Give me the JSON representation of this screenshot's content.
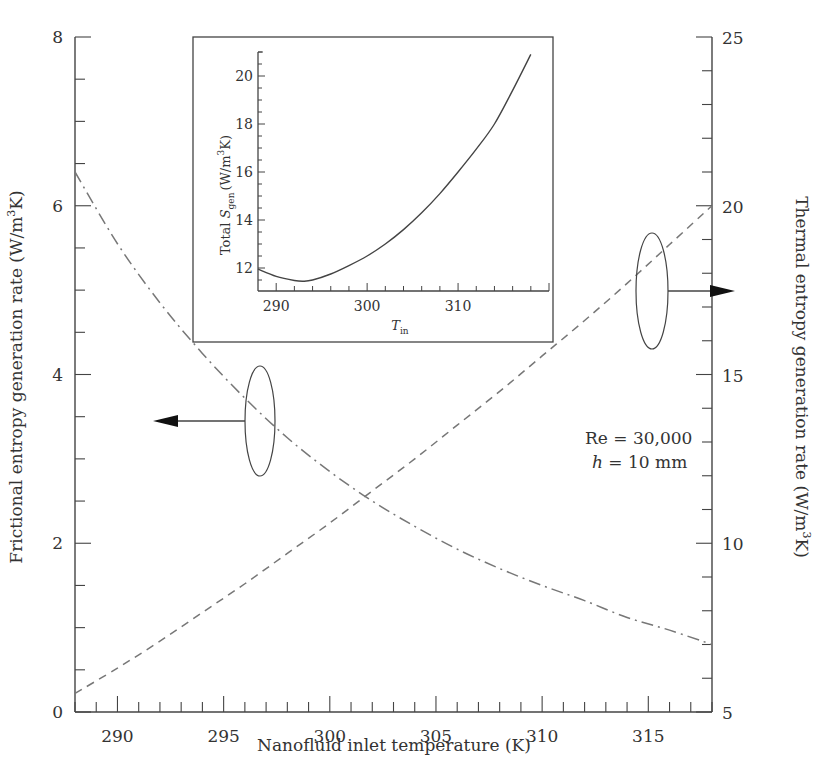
{
  "chart_data": [
    {
      "id": "main",
      "type": "line",
      "title": "",
      "xlabel": "Nanofluid inlet temperature (K)",
      "ylabel_left": "Frictional entropy generation rate (W/m³K)",
      "ylabel_right": "Thermal entropy generation rate (W/m³K)",
      "xlim": [
        288,
        318
      ],
      "ylim_left": [
        0,
        8
      ],
      "ylim_right": [
        5,
        25
      ],
      "x_ticks": [
        290,
        295,
        300,
        305,
        310,
        315
      ],
      "y_left_ticks": [
        0,
        2,
        4,
        6,
        8
      ],
      "y_right_ticks": [
        5,
        10,
        15,
        20,
        25
      ],
      "grid": false,
      "series": [
        {
          "name": "Frictional entropy generation rate",
          "axis": "left",
          "style": "dash-dot",
          "x": [
            288,
            290,
            292,
            294,
            296,
            298,
            300,
            302,
            304,
            306,
            308,
            310,
            312,
            314,
            316,
            318
          ],
          "values": [
            6.4,
            5.55,
            4.85,
            4.25,
            3.72,
            3.25,
            2.85,
            2.5,
            2.2,
            1.93,
            1.7,
            1.5,
            1.32,
            1.12,
            0.97,
            0.8
          ]
        },
        {
          "name": "Thermal entropy generation rate",
          "axis": "right",
          "style": "dashed",
          "x": [
            288,
            290,
            292,
            294,
            296,
            298,
            300,
            302,
            304,
            306,
            308,
            310,
            312,
            314,
            316,
            318
          ],
          "values": [
            5.55,
            6.3,
            7.1,
            7.95,
            8.8,
            9.7,
            10.6,
            11.55,
            12.5,
            13.5,
            14.5,
            15.55,
            16.6,
            17.7,
            18.85,
            20.0
          ]
        }
      ],
      "annotations": [
        {
          "text": "Re = 30,000"
        },
        {
          "text": "h = 10 mm",
          "italic_part": "h"
        },
        {
          "type": "ellipse-arrow",
          "points_to": "left axis",
          "series": "Frictional entropy generation rate"
        },
        {
          "type": "ellipse-arrow",
          "points_to": "right axis",
          "series": "Thermal entropy generation rate"
        }
      ]
    },
    {
      "id": "inset",
      "type": "line",
      "title": "",
      "xlabel": "T_in",
      "ylabel": "Total S_gen (W/m³K)",
      "xlim": [
        288,
        320
      ],
      "ylim": [
        11,
        21
      ],
      "x_ticks": [
        290,
        300,
        310,
        320
      ],
      "y_ticks": [
        12,
        14,
        16,
        18,
        20
      ],
      "grid": false,
      "series": [
        {
          "name": "Total S_gen",
          "style": "solid",
          "x": [
            288,
            290,
            292,
            293,
            294,
            296,
            298,
            300,
            302,
            304,
            306,
            308,
            310,
            312,
            314,
            316,
            318
          ],
          "values": [
            11.95,
            11.65,
            11.48,
            11.45,
            11.5,
            11.75,
            12.1,
            12.5,
            13.0,
            13.6,
            14.3,
            15.1,
            16.0,
            16.95,
            18.0,
            19.4,
            20.9
          ]
        }
      ]
    }
  ],
  "labels": {
    "xlabel": "Nanofluid inlet temperature (K)",
    "ylabel_left": "Frictional entropy generation rate (W/m",
    "ylabel_left_sup": "3",
    "ylabel_left_end": "K)",
    "ylabel_right": "Thermal entropy generation rate (W/m",
    "ylabel_right_sup": "3",
    "ylabel_right_end": "K)",
    "inset_ylabel_pre": "Total ",
    "inset_ylabel_S": "S",
    "inset_ylabel_sub": "gen",
    "inset_ylabel_unit": "(W/m",
    "inset_ylabel_sup": "3",
    "inset_ylabel_end": "K)",
    "inset_xlabel_T": "T",
    "inset_xlabel_sub": "in",
    "annot_re": "Re = 30,000",
    "annot_h_var": "h",
    "annot_h_rest": " = 10 mm"
  },
  "colors": {
    "axis": "#444444",
    "series_line": "#777777",
    "inset_line": "#444444",
    "text": "#333333"
  }
}
